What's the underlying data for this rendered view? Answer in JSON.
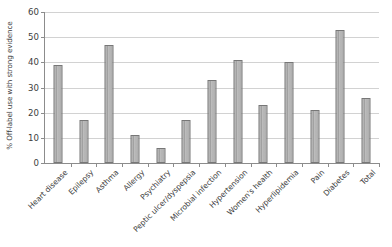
{
  "chart_data": {
    "type": "bar",
    "title": "",
    "xlabel": "",
    "ylabel": "% Off-label use with strong evidence",
    "ylim": [
      0,
      60
    ],
    "ytick_step": 10,
    "yticks": [
      0,
      10,
      20,
      30,
      40,
      50,
      60
    ],
    "grid": true,
    "legend": "none",
    "categories": [
      "Heart disease",
      "Epilepsy",
      "Asthma",
      "Allergy",
      "Psychiatry",
      "Peptic ulcer/dyspepsia",
      "Microbial infection",
      "Hypertension",
      "Women's health",
      "Hyperlipidemia",
      "Pain",
      "Diabetes",
      "Total"
    ],
    "values": [
      39,
      17,
      47,
      11,
      6,
      17,
      33,
      41,
      23,
      40,
      21,
      53,
      26
    ],
    "bar_color": "#b0b0b0",
    "bar_edge_color": "#777777",
    "grid_color": "#d2d2d2",
    "axis_color": "#8c8c8c"
  }
}
